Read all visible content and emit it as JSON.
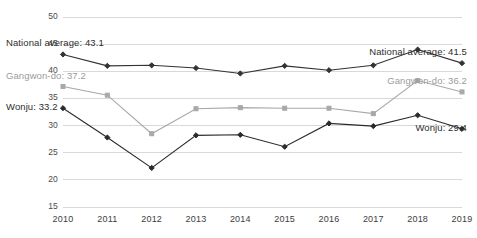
{
  "chart_data": {
    "type": "line",
    "title": "",
    "xlabel": "",
    "ylabel": "",
    "x": [
      2010,
      2011,
      2012,
      2013,
      2014,
      2015,
      2016,
      2017,
      2018,
      2019
    ],
    "categories": [
      "2010",
      "2011",
      "2012",
      "2013",
      "2014",
      "2015",
      "2016",
      "2017",
      "2018",
      "2019"
    ],
    "ylim": [
      15,
      50
    ],
    "yticks": [
      15,
      20,
      25,
      30,
      35,
      40,
      45,
      50
    ],
    "ytick_labels": [
      "15",
      "20",
      "25",
      "30",
      "35",
      "40",
      "45",
      "50"
    ],
    "grid": true,
    "legend_position": "none",
    "series": [
      {
        "name": "National average",
        "color": "#333333",
        "marker": "diamond",
        "values": [
          43.1,
          41.0,
          41.1,
          40.6,
          39.6,
          41.0,
          40.2,
          41.1,
          44.0,
          41.5
        ]
      },
      {
        "name": "Gangwon-do",
        "color": "#a8a8a8",
        "marker": "square",
        "values": [
          37.2,
          35.6,
          28.5,
          33.1,
          33.3,
          33.2,
          33.2,
          32.2,
          38.3,
          36.2
        ]
      },
      {
        "name": "Wonju",
        "color": "#2b2b2b",
        "marker": "diamond",
        "values": [
          33.2,
          27.8,
          22.2,
          28.2,
          28.3,
          26.1,
          30.4,
          29.9,
          31.9,
          29.4
        ]
      }
    ],
    "annotations": [
      {
        "id": "national-left",
        "text": "National average: 43.1",
        "series": "National average",
        "side": "left",
        "value": 43.1
      },
      {
        "id": "national-right",
        "text": "National average: 41.5",
        "series": "National average",
        "side": "right",
        "value": 41.5
      },
      {
        "id": "gangwon-left",
        "text": "Gangwon-do: 37.2",
        "series": "Gangwon-do",
        "side": "left",
        "value": 37.2
      },
      {
        "id": "gangwon-right",
        "text": "Gangwon-do: 36.2",
        "series": "Gangwon-do",
        "side": "right",
        "value": 36.2
      },
      {
        "id": "wonju-left",
        "text": "Wonju: 33.2",
        "series": "Wonju",
        "side": "left",
        "value": 33.2
      },
      {
        "id": "wonju-right",
        "text": "Wonju: 29.4",
        "series": "Wonju",
        "side": "right",
        "value": 29.4
      }
    ]
  },
  "annotations_text": {
    "national_left": "National average: 43.1",
    "national_right": "National average: 41.5",
    "gangwon_left": "Gangwon-do: 37.2",
    "gangwon_right": "Gangwon-do: 36.2",
    "wonju_left": "Wonju: 33.2",
    "wonju_right": "Wonju: 29.4"
  },
  "axis": {
    "y_labels": [
      "50",
      "45",
      "40",
      "35",
      "30",
      "25",
      "20",
      "15"
    ],
    "x_labels": [
      "2010",
      "2011",
      "2012",
      "2013",
      "2014",
      "2015",
      "2016",
      "2017",
      "2018",
      "2019"
    ]
  },
  "colors": {
    "national": "#333333",
    "gangwon": "#a8a8a8",
    "wonju": "#2b2b2b",
    "grid": "#d9d9d9",
    "text": "#3d3d3d"
  }
}
